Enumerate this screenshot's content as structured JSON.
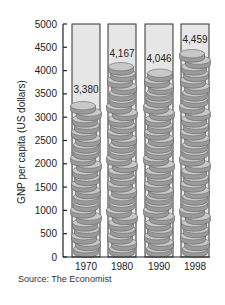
{
  "chart_data": {
    "type": "bar",
    "title": "",
    "categories": [
      "1970",
      "1980",
      "1990",
      "1998"
    ],
    "values": [
      3380,
      4167,
      4046,
      4459
    ],
    "value_labels": [
      "3,380",
      "4,167",
      "4,046",
      "4,459"
    ],
    "xlabel": "",
    "ylabel": "GNP per capita (US dollars)",
    "ylim": [
      0,
      5000
    ],
    "yticks": [
      0,
      500,
      1000,
      1500,
      2000,
      2500,
      3000,
      3500,
      4000,
      4500,
      5000
    ],
    "grid": false,
    "legend": null,
    "style": "stacked coins inside columns",
    "source": "Source: The Economist"
  },
  "colors": {
    "column_fill": "#e6e6e6",
    "column_border": "#333333",
    "coin_top": "#c8c8c8",
    "coin_side": "#9a9a9a",
    "coin_edge": "#555555",
    "axis": "#222222"
  }
}
